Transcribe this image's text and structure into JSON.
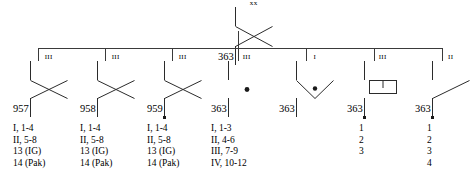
{
  "diagram": {
    "line_color": "#3a3a3a",
    "symbol_color": "#2b2b2b"
  },
  "root": {
    "designation": "363",
    "echelon": "xx",
    "symbol": "infantry-cross-symbol",
    "motorized": false
  },
  "units": [
    {
      "designation": "957",
      "echelon": "III",
      "symbol": "infantry-cross-symbol",
      "motorized": false,
      "subordinates": [
        "I, 1-4",
        "II, 5-8",
        "13 (IG)",
        "14 (Pak)"
      ]
    },
    {
      "designation": "958",
      "echelon": "III",
      "symbol": "infantry-cross-symbol",
      "motorized": false,
      "subordinates": [
        "I, 1-4",
        "II, 5-8",
        "13 (IG)",
        "14 (Pak)"
      ]
    },
    {
      "designation": "959",
      "echelon": "III",
      "symbol": "infantry-cross-symbol",
      "motorized": true,
      "subordinates": [
        "I, 1-4",
        "II, 5-8",
        "13 (IG)",
        "14 (Pak)"
      ]
    },
    {
      "designation": "363",
      "echelon": "III",
      "symbol": "artillery-dot-symbol",
      "motorized": false,
      "subordinates": [
        "I, 1-3",
        "II, 4-6",
        "III, 7-9",
        "IV, 10-12"
      ]
    },
    {
      "designation": "363",
      "echelon": "I",
      "symbol": "engineer-chevron-dot-symbol",
      "motorized": false,
      "subordinates": []
    },
    {
      "designation": "363",
      "echelon": "III",
      "symbol": "signals-symbol",
      "motorized": true,
      "subordinates": [
        "1",
        "2",
        "3"
      ]
    },
    {
      "designation": "363",
      "echelon": "II",
      "symbol": "supply-diagonal-symbol",
      "motorized": true,
      "subordinates": [
        "1",
        "2",
        "3",
        "4"
      ]
    }
  ]
}
